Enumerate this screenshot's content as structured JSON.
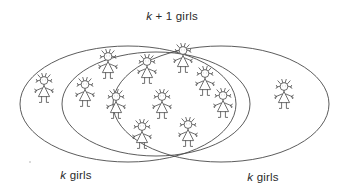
{
  "diagram": {
    "kind": "venn-diagram",
    "title_label": {
      "prefix": "k",
      "suffix": " + 1 girls",
      "full_text": "k + 1 girls"
    },
    "left_label": {
      "prefix": "k",
      "suffix": " girls",
      "full_text": "k girls"
    },
    "right_label": {
      "prefix": "k",
      "suffix": " girls",
      "full_text": "k girls"
    },
    "colors": {
      "background": "#ffffff",
      "outline": "#4a4a4a",
      "figure_stroke": "#555555",
      "text": "#2b2b2b"
    },
    "sets": [
      {
        "name": "left-set",
        "label": "k girls",
        "figure_count": 11
      },
      {
        "name": "right-set",
        "label": "k girls",
        "figure_count": 11
      },
      {
        "name": "union-set",
        "label": "k + 1 girls",
        "figure_count": 12
      }
    ],
    "regions": {
      "left_only_count": 1,
      "intersection_count": 10,
      "right_only_count": 1,
      "total_count": 12
    },
    "ellipses": [
      {
        "name": "left-ellipse",
        "cx": 128,
        "cy": 104,
        "rx": 108,
        "ry": 58,
        "label": "k girls"
      },
      {
        "name": "right-ellipse",
        "cx": 221,
        "cy": 104,
        "rx": 108,
        "ry": 58,
        "label": "k girls"
      },
      {
        "name": "middle-ellipse",
        "cx": 156,
        "cy": 104,
        "rx": 94,
        "ry": 52,
        "label": "k + 1 girls"
      }
    ],
    "figures": [
      {
        "id": "girl-1",
        "region": "left-only",
        "x": 44,
        "y": 96
      },
      {
        "id": "girl-2",
        "region": "intersection",
        "x": 85,
        "y": 100
      },
      {
        "id": "girl-3",
        "region": "intersection",
        "x": 108,
        "y": 72
      },
      {
        "id": "girl-4",
        "region": "intersection",
        "x": 116,
        "y": 112
      },
      {
        "id": "girl-5",
        "region": "intersection",
        "x": 147,
        "y": 77
      },
      {
        "id": "girl-6",
        "region": "intersection",
        "x": 162,
        "y": 112
      },
      {
        "id": "girl-7",
        "region": "intersection",
        "x": 183,
        "y": 66
      },
      {
        "id": "girl-8",
        "region": "intersection",
        "x": 142,
        "y": 142
      },
      {
        "id": "girl-9",
        "region": "intersection",
        "x": 188,
        "y": 140
      },
      {
        "id": "girl-10",
        "region": "intersection",
        "x": 205,
        "y": 89
      },
      {
        "id": "girl-11",
        "region": "intersection",
        "x": 223,
        "y": 111
      },
      {
        "id": "girl-12",
        "region": "right-only",
        "x": 284,
        "y": 102
      }
    ]
  }
}
